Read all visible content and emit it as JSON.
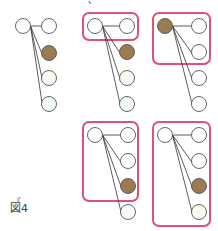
{
  "figure": {
    "label": "図4",
    "ruby": "ず",
    "tick_mark": true
  },
  "colors": {
    "node_stroke": "#555555",
    "node_fill_empty": "#ffffff",
    "node_fill_filled": "#9c7a52",
    "node_fill_pale": "#fbfaf0",
    "node_fill_pale_blue": "#f4f9fb",
    "highlight_box": "#e0507a",
    "edge": "#333333"
  },
  "groups": [
    {
      "id": "g1",
      "left": {
        "x": 23,
        "y": 26,
        "filled": false
      },
      "right": [
        {
          "x": 49,
          "y": 26,
          "fill": "empty"
        },
        {
          "x": 49,
          "y": 53,
          "fill": "filled"
        },
        {
          "x": 49,
          "y": 78,
          "fill": "pale"
        },
        {
          "x": 49,
          "y": 104,
          "fill": "pale_blue"
        }
      ],
      "box": null
    },
    {
      "id": "g2",
      "left": {
        "x": 95,
        "y": 26,
        "filled": false
      },
      "right": [
        {
          "x": 127,
          "y": 26,
          "fill": "empty"
        },
        {
          "x": 127,
          "y": 52,
          "fill": "filled"
        },
        {
          "x": 127,
          "y": 78,
          "fill": "pale"
        },
        {
          "x": 127,
          "y": 104,
          "fill": "pale_blue"
        }
      ],
      "box": {
        "x": 83,
        "y": 13,
        "w": 55,
        "h": 27
      }
    },
    {
      "id": "g3",
      "left": {
        "x": 165,
        "y": 26,
        "filled": true
      },
      "right": [
        {
          "x": 199,
          "y": 26,
          "fill": "empty"
        },
        {
          "x": 199,
          "y": 52,
          "fill": "empty"
        },
        {
          "x": 199,
          "y": 78,
          "fill": "empty"
        },
        {
          "x": 199,
          "y": 104,
          "fill": "empty"
        }
      ],
      "box": {
        "x": 153,
        "y": 13,
        "w": 57,
        "h": 51
      }
    },
    {
      "id": "g4",
      "left": {
        "x": 95,
        "y": 135,
        "filled": false
      },
      "right": [
        {
          "x": 128,
          "y": 135,
          "fill": "empty"
        },
        {
          "x": 128,
          "y": 161,
          "fill": "empty"
        },
        {
          "x": 128,
          "y": 186,
          "fill": "filled"
        },
        {
          "x": 128,
          "y": 212,
          "fill": "pale_blue"
        }
      ],
      "box": {
        "x": 83,
        "y": 122,
        "w": 55,
        "h": 79
      }
    },
    {
      "id": "g5",
      "left": {
        "x": 165,
        "y": 135,
        "filled": false
      },
      "right": [
        {
          "x": 199,
          "y": 135,
          "fill": "empty"
        },
        {
          "x": 199,
          "y": 161,
          "fill": "empty"
        },
        {
          "x": 199,
          "y": 186,
          "fill": "filled"
        },
        {
          "x": 199,
          "y": 212,
          "fill": "pale"
        }
      ],
      "box": {
        "x": 153,
        "y": 122,
        "w": 57,
        "h": 104
      }
    }
  ]
}
